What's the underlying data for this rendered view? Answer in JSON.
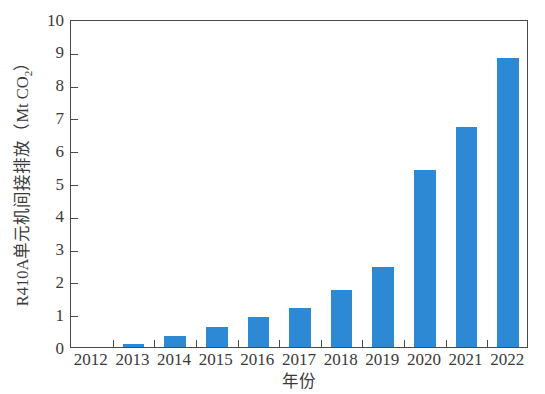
{
  "chart_data": {
    "type": "bar",
    "title": "",
    "xlabel": "年份",
    "ylabel": "R410A单元机间接排放（Mt CO₂）",
    "ylabel_main": "R410A单元机间接排放（Mt CO",
    "ylabel_sub": "2",
    "ylabel_tail": "）",
    "categories": [
      "2012",
      "2013",
      "2014",
      "2015",
      "2016",
      "2017",
      "2018",
      "2019",
      "2020",
      "2021",
      "2022"
    ],
    "values": [
      0,
      0.1,
      0.35,
      0.6,
      0.9,
      1.2,
      1.75,
      2.45,
      5.4,
      6.7,
      8.8
    ],
    "series": [
      {
        "name": "R410A单元机间接排放",
        "values": [
          0,
          0.1,
          0.35,
          0.6,
          0.9,
          1.2,
          1.75,
          2.45,
          5.4,
          6.7,
          8.8
        ]
      }
    ],
    "ylim": [
      0,
      10
    ],
    "ytick_values": [
      0,
      1,
      2,
      3,
      4,
      5,
      6,
      7,
      8,
      9,
      10
    ],
    "ytick_labels": [
      "0",
      "1",
      "2",
      "3",
      "4",
      "5",
      "6",
      "7",
      "8",
      "9",
      "10"
    ],
    "grid": false,
    "legend": false,
    "legend_position": "none",
    "bar_color": "#2e89d4",
    "axis_color": "#4a4a4a",
    "background_color": "#ffffff"
  }
}
